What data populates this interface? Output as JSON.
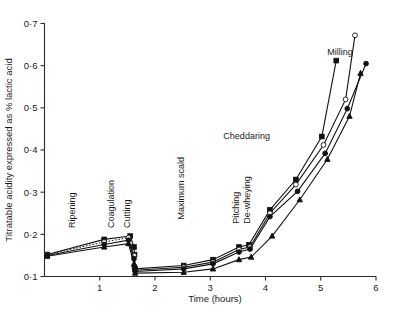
{
  "chart_data": {
    "type": "line",
    "title": "",
    "xlabel": "Time (hours)",
    "ylabel": "Titratable acidity expressed as % lactic acid",
    "xlim": [
      0,
      6
    ],
    "ylim": [
      0.1,
      0.7
    ],
    "xticks": [
      1,
      2,
      3,
      4,
      5,
      6
    ],
    "xtick_labels": [
      "1",
      "2",
      "3",
      "4",
      "5",
      "6"
    ],
    "yticks": [
      0.1,
      0.2,
      0.3,
      0.4,
      0.5,
      0.6,
      0.7
    ],
    "ytick_labels": [
      "0·1",
      "0·2",
      "0·3",
      "0·4",
      "0·5",
      "0·6",
      "0·7"
    ],
    "grid": false,
    "legend": "none",
    "annotations": [
      {
        "text": "Ripening",
        "x": 0.55,
        "y": 0.215,
        "rotation": -90
      },
      {
        "text": "Coagulation",
        "x": 1.25,
        "y": 0.215,
        "rotation": -90
      },
      {
        "text": "Cutting",
        "x": 1.55,
        "y": 0.215,
        "rotation": -90
      },
      {
        "text": "Maximum scald",
        "x": 2.52,
        "y": 0.235,
        "rotation": -90
      },
      {
        "text": "Pitching",
        "x": 3.52,
        "y": 0.225,
        "rotation": -90
      },
      {
        "text": "De-wheying",
        "x": 3.72,
        "y": 0.225,
        "rotation": -90
      },
      {
        "text": "Cheddaring",
        "x": 4.08,
        "y": 0.425,
        "rotation": 0
      },
      {
        "text": "Milling",
        "x": 5.58,
        "y": 0.625,
        "rotation": 0
      }
    ],
    "series": [
      {
        "name": "vat-1",
        "marker": "filled-square",
        "line": "solid",
        "points": [
          [
            0.05,
            0.152
          ],
          [
            1.08,
            0.188
          ],
          [
            1.55,
            0.196
          ],
          [
            1.62,
            0.17
          ],
          [
            1.63,
            0.152
          ],
          [
            1.64,
            0.118
          ],
          [
            2.52,
            0.126
          ],
          [
            3.05,
            0.14
          ],
          [
            3.52,
            0.17
          ],
          [
            3.7,
            0.175
          ],
          [
            4.08,
            0.258
          ],
          [
            4.55,
            0.33
          ],
          [
            5.02,
            0.432
          ],
          [
            5.28,
            0.612
          ]
        ]
      },
      {
        "name": "vat-2",
        "marker": "open-circle",
        "line": "dotted-then-solid",
        "points": [
          [
            0.05,
            0.152
          ],
          [
            1.08,
            0.182
          ],
          [
            1.52,
            0.192
          ],
          [
            1.62,
            0.15
          ],
          [
            1.63,
            0.124
          ],
          [
            1.64,
            0.115
          ],
          [
            2.52,
            0.122
          ],
          [
            3.05,
            0.134
          ],
          [
            3.52,
            0.164
          ],
          [
            3.72,
            0.17
          ],
          [
            4.08,
            0.25
          ],
          [
            4.55,
            0.318
          ],
          [
            5.05,
            0.412
          ],
          [
            5.45,
            0.52
          ],
          [
            5.62,
            0.672
          ]
        ]
      },
      {
        "name": "vat-3",
        "marker": "filled-circle",
        "line": "solid",
        "points": [
          [
            0.05,
            0.15
          ],
          [
            1.08,
            0.176
          ],
          [
            1.52,
            0.186
          ],
          [
            1.62,
            0.142
          ],
          [
            1.63,
            0.12
          ],
          [
            1.64,
            0.112
          ],
          [
            2.52,
            0.118
          ],
          [
            3.05,
            0.13
          ],
          [
            3.52,
            0.158
          ],
          [
            3.72,
            0.165
          ],
          [
            4.08,
            0.242
          ],
          [
            4.58,
            0.302
          ],
          [
            5.08,
            0.392
          ],
          [
            5.48,
            0.498
          ],
          [
            5.82,
            0.605
          ]
        ]
      },
      {
        "name": "vat-4",
        "marker": "filled-triangle",
        "line": "solid",
        "points": [
          [
            0.05,
            0.148
          ],
          [
            1.08,
            0.17
          ],
          [
            1.52,
            0.178
          ],
          [
            1.62,
            0.13
          ],
          [
            1.64,
            0.108
          ],
          [
            2.52,
            0.11
          ],
          [
            3.05,
            0.118
          ],
          [
            3.52,
            0.14
          ],
          [
            3.74,
            0.146
          ],
          [
            4.12,
            0.196
          ],
          [
            4.62,
            0.282
          ],
          [
            5.12,
            0.378
          ],
          [
            5.52,
            0.48
          ],
          [
            5.72,
            0.582
          ]
        ]
      }
    ]
  },
  "axes": {
    "x_title": "Time (hours)",
    "y_title": "Titratable acidity expressed as % lactic acid"
  }
}
